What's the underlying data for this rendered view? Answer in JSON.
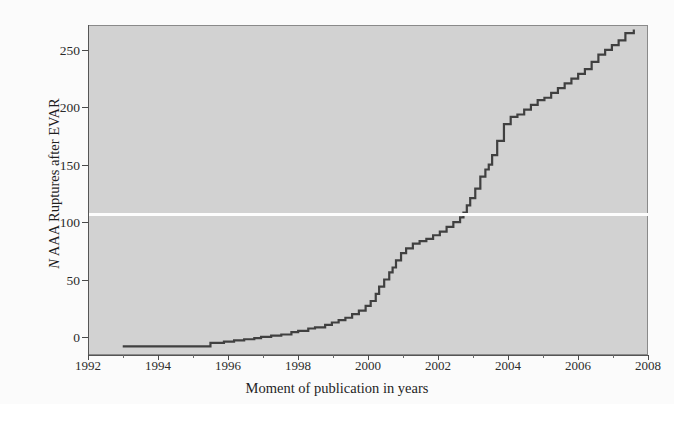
{
  "figure": {
    "background_color": "#ffffff",
    "plot_background_color": "#d2d2d2",
    "line_color": "#404040",
    "axis_color": "#555555"
  },
  "axes": {
    "ylabel_prefix": "N",
    "ylabel_rest": " AAA Ruptures after EVAR",
    "xlabel": "Moment of publication in years",
    "xticks": [
      "1992",
      "1994",
      "1996",
      "1998",
      "2000",
      "2002",
      "2004",
      "2006",
      "2008"
    ],
    "yticks": [
      "0",
      "50",
      "100",
      "150",
      "200",
      "250"
    ]
  },
  "chart_data": {
    "type": "line",
    "title": "",
    "xlabel": "Moment of publication in years",
    "ylabel": "N AAA Ruptures after EVAR",
    "xlim": [
      1992,
      2008.6
    ],
    "ylim": [
      -8,
      268
    ],
    "grid": false,
    "legend": null,
    "step": "post",
    "series": [
      {
        "name": "Cumulative AAA ruptures after EVAR",
        "x": [
          1993.0,
          1995.4,
          1995.6,
          1996.0,
          1996.3,
          1996.6,
          1996.9,
          1997.1,
          1997.4,
          1997.7,
          1998.0,
          1998.2,
          1998.5,
          1998.7,
          1999.0,
          1999.2,
          1999.4,
          1999.6,
          1999.8,
          2000.0,
          2000.2,
          2000.35,
          2000.5,
          2000.6,
          2000.75,
          2000.9,
          2001.0,
          2001.1,
          2001.25,
          2001.4,
          2001.6,
          2001.8,
          2002.0,
          2002.2,
          2002.4,
          2002.6,
          2002.8,
          2003.0,
          2003.1,
          2003.2,
          2003.3,
          2003.45,
          2003.6,
          2003.75,
          2003.85,
          2003.95,
          2004.1,
          2004.3,
          2004.5,
          2004.7,
          2004.9,
          2005.1,
          2005.3,
          2005.5,
          2005.7,
          2005.9,
          2006.1,
          2006.3,
          2006.5,
          2006.7,
          2006.9,
          2007.1,
          2007.3,
          2007.5,
          2007.7,
          2007.9,
          2008.15
        ],
        "y": [
          0,
          0,
          3,
          4,
          5,
          6,
          7,
          8,
          9,
          10,
          12,
          13,
          15,
          16,
          18,
          20,
          22,
          24,
          27,
          30,
          34,
          38,
          44,
          50,
          56,
          62,
          66,
          72,
          78,
          82,
          86,
          88,
          90,
          93,
          96,
          100,
          104,
          108,
          112,
          118,
          124,
          132,
          142,
          148,
          152,
          160,
          172,
          186,
          192,
          194,
          198,
          202,
          206,
          208,
          212,
          216,
          220,
          224,
          228,
          232,
          238,
          244,
          248,
          252,
          256,
          262,
          265
        ]
      }
    ]
  }
}
